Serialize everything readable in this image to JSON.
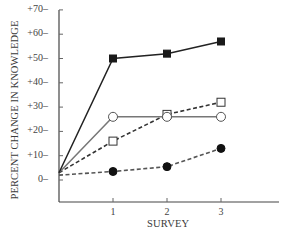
{
  "chart_data": {
    "type": "line",
    "title": "",
    "xlabel": "SURVEY",
    "ylabel": "PERCENT CHANGE IN KNOWLEDGE",
    "x": [
      0,
      1,
      2,
      3
    ],
    "x_tick_labels": [
      "1",
      "2",
      "3"
    ],
    "y_tick_labels": [
      "+70",
      "+60",
      "+50",
      "+40",
      "+30",
      "+20",
      "+10",
      "0"
    ],
    "y_ticks": [
      70,
      60,
      50,
      40,
      30,
      20,
      10,
      0
    ],
    "ylim": [
      -8,
      72
    ],
    "xlim": [
      0,
      4
    ],
    "grid": false,
    "legend": null,
    "series": [
      {
        "name": "filled-square-solid",
        "marker": "filled-square",
        "line": "solid",
        "color": "#222222",
        "values": [
          3,
          50,
          52,
          57
        ]
      },
      {
        "name": "open-circle-solid",
        "marker": "open-circle",
        "line": "solid",
        "color": "#777777",
        "values": [
          3,
          26,
          26,
          26
        ]
      },
      {
        "name": "open-square-dashed",
        "marker": "open-square",
        "line": "dashed",
        "color": "#333333",
        "values": [
          3,
          16,
          27,
          32
        ]
      },
      {
        "name": "filled-circle-dashed",
        "marker": "filled-circle",
        "line": "dashed",
        "color": "#555555",
        "values": [
          2,
          3.5,
          5.5,
          13
        ]
      }
    ]
  },
  "axes": {
    "xlabel": "SURVEY",
    "ylabel": "PERCENT CHANGE IN KNOWLEDGE"
  }
}
